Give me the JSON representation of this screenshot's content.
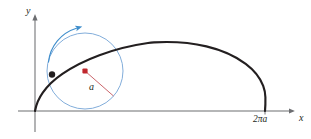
{
  "figure": {
    "background_color": "#ffffff"
  },
  "axes": {
    "x_axis_label": "x",
    "y_axis_label": "y",
    "x_axis_color": "#6d6e71",
    "y_axis_color": "#6d6e71",
    "origin_px": [
      35,
      111
    ],
    "x_axis_end_px": [
      295,
      111
    ],
    "y_axis_top_px": [
      35,
      14
    ],
    "ticks": [
      {
        "name": "two-pi-a-tick",
        "label": "2πa",
        "axis": "x",
        "x_px": 265
      }
    ]
  },
  "curve": {
    "name": "cycloid",
    "color": "#231f20",
    "stroke_width": 2.1,
    "start_px": [
      35,
      111
    ],
    "apex_px": [
      152,
      33
    ],
    "end_px": [
      265,
      111
    ]
  },
  "rolling_circle": {
    "name": "rolling-circle",
    "color": "#7ba9d8",
    "stroke_width": 0.9,
    "center_px": [
      85,
      71
    ],
    "radius_px": 38,
    "radius_label": "a",
    "radius_line_color": "#c04a52",
    "center_dot_color": "#c0272d"
  },
  "generating_point": {
    "name": "generating-point",
    "color": "#231f20",
    "position_px": [
      52,
      74
    ],
    "radius_px": 3.1
  },
  "rotation_arrow": {
    "name": "rotation-arrow",
    "color": "#3f8ecc",
    "direction": "clockwise",
    "stroke_width": 1.1
  },
  "colors": {
    "curve": "#231f20",
    "circle": "#7ba9d8",
    "arrow": "#3f8ecc",
    "radius": "#c04a52",
    "center": "#c0272d",
    "axis": "#6d6e71",
    "text": "#231f20"
  }
}
